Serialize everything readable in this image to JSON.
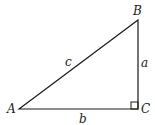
{
  "diagram": {
    "type": "right-triangle",
    "vertices": {
      "A": {
        "label": "A"
      },
      "B": {
        "label": "B"
      },
      "C": {
        "label": "C"
      }
    },
    "sides": {
      "hypotenuse": {
        "label": "c"
      },
      "vertical": {
        "label": "a"
      },
      "base": {
        "label": "b"
      }
    },
    "right_angle_at": "C",
    "colors": {
      "stroke": "#1a1a1a",
      "background": "#ffffff"
    }
  }
}
